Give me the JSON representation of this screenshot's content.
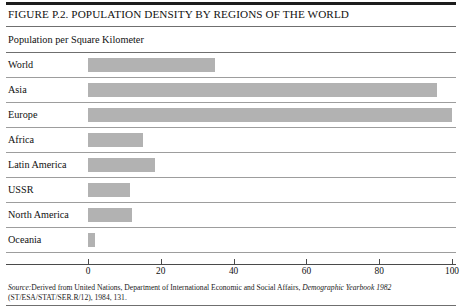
{
  "figure": {
    "title": "FIGURE P.2. POPULATION DENSITY BY REGIONS OF THE WORLD",
    "subtitle": "Population per Square Kilometer",
    "source_prefix": "Source:",
    "source_line1_a": "Derived from United Nations, Department of International Economic and Social Affairs, ",
    "source_line1_italic": "Demographic Yearbook 1982",
    "source_line2": "(ST/ESA/STAT/SER.R/12), 1984, 131."
  },
  "chart_data": {
    "type": "bar",
    "orientation": "horizontal",
    "title": "FIGURE P.2. POPULATION DENSITY BY REGIONS OF THE WORLD",
    "subtitle": "Population per Square Kilometer",
    "xlabel": "",
    "ylabel": "",
    "xlim": [
      0,
      100
    ],
    "xticks": [
      0,
      20,
      40,
      60,
      80,
      100
    ],
    "xtick_labels": [
      "0",
      "20",
      "40",
      "60",
      "80",
      "100"
    ],
    "grid": false,
    "legend": "none",
    "bar_color": "#b2b2b2",
    "categories": [
      "World",
      "Asia",
      "Europe",
      "Africa",
      "Latin America",
      "USSR",
      "North America",
      "Oceania"
    ],
    "values": [
      35,
      96,
      100,
      15,
      18.5,
      11.5,
      12,
      2
    ]
  }
}
